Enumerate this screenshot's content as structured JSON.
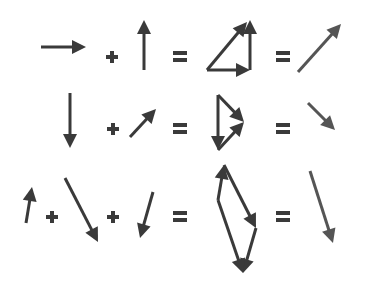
{
  "colors": {
    "arrow": "#3a3a3a",
    "result_arrow": "#555555",
    "background": "#ffffff"
  },
  "rows": [
    {
      "id": "row-1",
      "operators": [
        {
          "symbol": "+",
          "x": 112,
          "y": 57
        },
        {
          "symbol": "=",
          "x": 180,
          "y": 57
        },
        {
          "symbol": "=",
          "x": 283,
          "y": 57
        }
      ],
      "operands": [
        {
          "name": "vector-right",
          "from": [
            41,
            47
          ],
          "to": [
            86,
            47
          ]
        },
        {
          "name": "vector-up",
          "from": [
            144,
            70
          ],
          "to": [
            144,
            20
          ]
        }
      ],
      "construction": [
        {
          "name": "construct-right",
          "from": [
            207,
            70
          ],
          "to": [
            250,
            70
          ]
        },
        {
          "name": "construct-up",
          "from": [
            250,
            70
          ],
          "to": [
            250,
            20
          ]
        },
        {
          "name": "construct-sum",
          "from": [
            207,
            70
          ],
          "to": [
            247,
            22
          ]
        }
      ],
      "result": {
        "name": "result-up-right",
        "from": [
          298,
          72
        ],
        "to": [
          341,
          24
        ]
      }
    },
    {
      "id": "row-2",
      "operators": [
        {
          "symbol": "+",
          "x": 113,
          "y": 129
        },
        {
          "symbol": "=",
          "x": 180,
          "y": 129
        },
        {
          "symbol": "=",
          "x": 283,
          "y": 129
        }
      ],
      "operands": [
        {
          "name": "vector-down",
          "from": [
            70,
            93
          ],
          "to": [
            70,
            148
          ]
        },
        {
          "name": "vector-up-right",
          "from": [
            130,
            137
          ],
          "to": [
            156,
            109
          ]
        }
      ],
      "construction": [
        {
          "name": "construct-down",
          "from": [
            218,
            95
          ],
          "to": [
            218,
            150
          ]
        },
        {
          "name": "construct-up-right",
          "from": [
            218,
            150
          ],
          "to": [
            244,
            122
          ]
        },
        {
          "name": "construct-sum",
          "from": [
            218,
            95
          ],
          "to": [
            244,
            122
          ]
        }
      ],
      "result": {
        "name": "result-down-right",
        "from": [
          308,
          103
        ],
        "to": [
          335,
          130
        ]
      }
    },
    {
      "id": "row-3",
      "operators": [
        {
          "symbol": "+",
          "x": 52,
          "y": 217
        },
        {
          "symbol": "+",
          "x": 113,
          "y": 217
        },
        {
          "symbol": "=",
          "x": 180,
          "y": 217
        },
        {
          "symbol": "=",
          "x": 283,
          "y": 217
        }
      ],
      "operands": [
        {
          "name": "vector-short-up",
          "from": [
            26,
            223
          ],
          "to": [
            32,
            187
          ]
        },
        {
          "name": "vector-long-down-right",
          "from": [
            65,
            178
          ],
          "to": [
            98,
            242
          ]
        },
        {
          "name": "vector-short-down-left",
          "from": [
            153,
            192
          ],
          "to": [
            140,
            238
          ]
        }
      ],
      "construction": [
        {
          "name": "construct-short-up",
          "from": [
            218,
            200
          ],
          "to": [
            224,
            165
          ]
        },
        {
          "name": "construct-long-down-right",
          "from": [
            224,
            165
          ],
          "to": [
            256,
            228
          ]
        },
        {
          "name": "construct-short-down-left",
          "from": [
            256,
            228
          ],
          "to": [
            243,
            273
          ]
        },
        {
          "name": "construct-sum",
          "from": [
            218,
            200
          ],
          "to": [
            243,
            273
          ]
        }
      ],
      "result": {
        "name": "result-down",
        "from": [
          310,
          171
        ],
        "to": [
          333,
          243
        ]
      }
    }
  ]
}
